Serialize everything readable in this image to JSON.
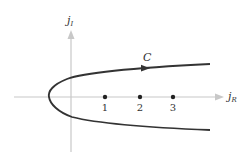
{
  "diagram": {
    "type": "contour-in-complex-plane",
    "axes": {
      "vertical": {
        "label_main": "j",
        "label_sub": "I"
      },
      "horizontal": {
        "label_main": "j",
        "label_sub": "R"
      }
    },
    "points": [
      {
        "label": "1",
        "value": 1
      },
      {
        "label": "2",
        "value": 2
      },
      {
        "label": "3",
        "value": 3
      }
    ],
    "contour": {
      "label": "C",
      "direction": "left-to-right on upper branch"
    },
    "colors": {
      "axis": "#c8c8c8",
      "curve": "#333333",
      "points": "#222222",
      "text": "#333333"
    }
  }
}
